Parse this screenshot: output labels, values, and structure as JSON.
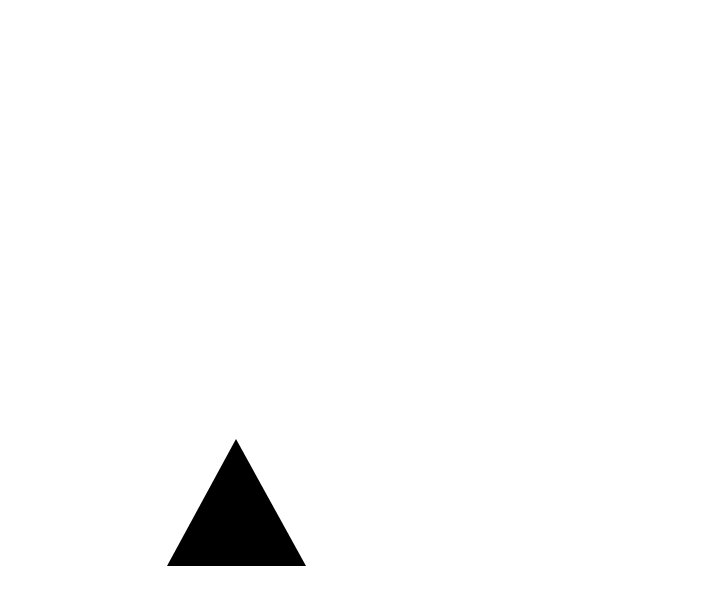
{
  "canvas": {
    "width": 723,
    "height": 610,
    "background": "#ffffff"
  },
  "shapes": [
    {
      "type": "triangle",
      "fill": "#000000",
      "points": [
        [
          236,
          439
        ],
        [
          306,
          566
        ],
        [
          167,
          566
        ]
      ]
    }
  ]
}
